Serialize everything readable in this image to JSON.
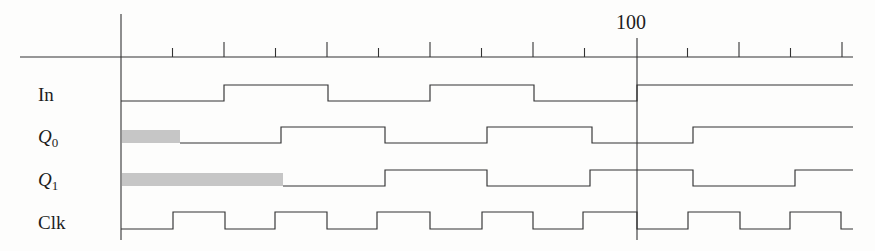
{
  "figure": {
    "kind": "timing-diagram",
    "background_color": "#fdfdfc",
    "line_color": "#333333",
    "unknown_band_color": "#c6c6c6",
    "width": 875,
    "height": 251
  },
  "axis": {
    "orientation": "horizontal",
    "x_start_px": 20,
    "x_end_px": 853,
    "y_px": 57,
    "origin_x_px": 121,
    "origin_label": "",
    "minor_tick_spacing_px": 51.5,
    "major_tick_spacing_px": 103,
    "units_per_major": 10,
    "tick_labels": [
      {
        "text": "100",
        "x_px": 637
      }
    ],
    "marker": {
      "label": "100",
      "x_px": 637,
      "y_top_px": 38,
      "y_bottom_px": 240
    }
  },
  "signals": [
    {
      "name": "In",
      "label": "In",
      "label_kind": "plain",
      "baseline_y_px": 101,
      "high_y_px": 85,
      "initial_state": "low",
      "transitions_px": [
        224,
        328,
        430,
        534,
        637
      ],
      "final_state": "high",
      "unknown_band": null
    },
    {
      "name": "Q0",
      "label": "Q",
      "label_kind": "subscripted",
      "label_subscript": "0",
      "baseline_y_px": 143,
      "high_y_px": 127,
      "initial_state": "low",
      "transitions_px": [
        281,
        385,
        487,
        592,
        693
      ],
      "final_state": "high",
      "unknown_band": {
        "x_start_px": 122,
        "x_end_px": 180
      }
    },
    {
      "name": "Q1",
      "label": "Q",
      "label_kind": "subscripted",
      "label_subscript": "1",
      "baseline_y_px": 186,
      "high_y_px": 170,
      "initial_state": "low",
      "transitions_px": [
        385,
        487,
        590,
        693,
        795
      ],
      "final_state": "high",
      "unknown_band": {
        "x_start_px": 122,
        "x_end_px": 283
      }
    },
    {
      "name": "Clk",
      "label": "Clk",
      "label_kind": "plain",
      "baseline_y_px": 229,
      "high_y_px": 212,
      "initial_state": "low",
      "transitions_px": [
        173,
        225,
        275,
        327,
        377,
        430,
        482,
        533,
        583,
        637,
        688,
        740,
        790,
        841
      ],
      "final_state": "low",
      "unknown_band": null
    }
  ],
  "chart_data": {
    "type": "line",
    "title": "",
    "xlabel": "",
    "ylabel": "",
    "x_tick_labels": [
      "100"
    ],
    "series": [
      {
        "name": "In",
        "waveform": "0 0 1 1 0 0 1 1 0 0 1 1 1 1",
        "unknown_prefix": false
      },
      {
        "name": "Q0",
        "waveform": "X X 0 0 1 1 0 0 1 1 0 0 1 1",
        "unknown_prefix": true
      },
      {
        "name": "Q1",
        "waveform": "X X X X 0 0 1 1 0 0 1 1 0 0",
        "unknown_prefix": true
      },
      {
        "name": "Clk",
        "waveform": "0 1 0 1 0 1 0 1 0 1 0 1 0 1",
        "unknown_prefix": false
      }
    ],
    "legend_position": "left-labels",
    "grid": false
  }
}
